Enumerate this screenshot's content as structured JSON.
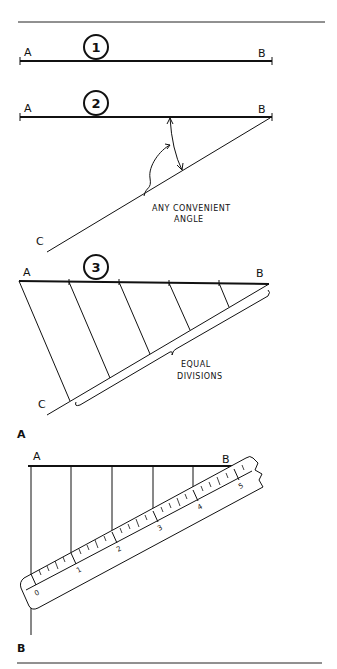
{
  "figure": {
    "panels": [
      {
        "id": "A",
        "label": "A"
      },
      {
        "id": "B",
        "label": "B"
      }
    ],
    "steps": [
      {
        "number": "1",
        "point_start": "A",
        "point_end": "B"
      },
      {
        "number": "2",
        "point_start": "A",
        "point_end": "B",
        "point_c": "C",
        "annotation_line1": "ANY CONVENIENT",
        "annotation_line2": "ANGLE"
      },
      {
        "number": "3",
        "point_start": "A",
        "point_end": "B",
        "point_c": "C",
        "annotation_line1": "EQUAL",
        "annotation_line2": "DIVISIONS"
      }
    ],
    "scale_method": {
      "point_start": "A",
      "point_end": "B",
      "scale_numbers": [
        "0",
        "1",
        "2",
        "3",
        "4",
        "5"
      ]
    }
  },
  "colors": {
    "ink": "#111111",
    "background": "#ffffff"
  }
}
